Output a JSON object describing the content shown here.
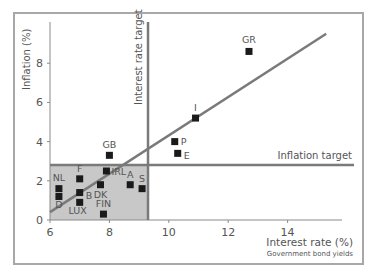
{
  "chart_data": {
    "type": "scatter",
    "title": "",
    "xlabel": "Interest rate (%)",
    "xlabel_sub": "Government bond yields",
    "ylabel": "Inflation (%)",
    "xlim": [
      6,
      16
    ],
    "ylim": [
      0,
      10
    ],
    "xticks": [
      6,
      8,
      10,
      12,
      14
    ],
    "yticks": [
      0,
      2,
      4,
      6,
      8
    ],
    "grid": false,
    "points": [
      {
        "label": "GR",
        "x": 12.7,
        "y": 8.6
      },
      {
        "label": "I",
        "x": 10.9,
        "y": 5.2
      },
      {
        "label": "P",
        "x": 10.2,
        "y": 4.0
      },
      {
        "label": "E",
        "x": 10.3,
        "y": 3.4
      },
      {
        "label": "GB",
        "x": 8.0,
        "y": 3.3
      },
      {
        "label": "IRL",
        "x": 7.9,
        "y": 2.5
      },
      {
        "label": "F",
        "x": 7.0,
        "y": 2.1
      },
      {
        "label": "NL",
        "x": 6.3,
        "y": 1.6
      },
      {
        "label": "D",
        "x": 6.3,
        "y": 1.2
      },
      {
        "label": "B",
        "x": 7.0,
        "y": 1.4
      },
      {
        "label": "LUX",
        "x": 7.0,
        "y": 0.9
      },
      {
        "label": "DK",
        "x": 7.7,
        "y": 1.8
      },
      {
        "label": "FIN",
        "x": 7.8,
        "y": 0.3
      },
      {
        "label": "A",
        "x": 8.7,
        "y": 1.8
      },
      {
        "label": "S",
        "x": 9.1,
        "y": 1.6
      }
    ],
    "trend_line": {
      "x0": 6.0,
      "y0": 0.4,
      "x1": 15.3,
      "y1": 9.5
    },
    "annotations": [
      {
        "text": "Interest rate target",
        "type": "vline",
        "x": 9.3
      },
      {
        "text": "Inflation target",
        "type": "hline",
        "y": 2.8
      }
    ],
    "shaded_region": {
      "x": [
        6,
        9.3
      ],
      "y": [
        0,
        2.8
      ],
      "color": "#c8c8c8"
    }
  },
  "colors": {
    "axis": "#8a8a8a",
    "line": "#7a7a7a",
    "marker": "#1a1a1a",
    "shade": "#c8c8c8",
    "text": "#555555"
  }
}
